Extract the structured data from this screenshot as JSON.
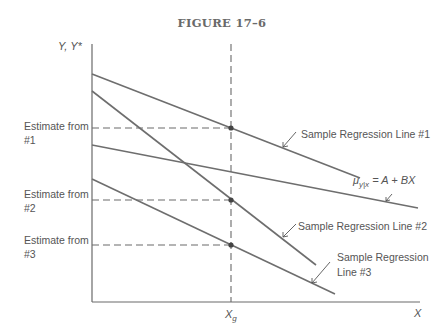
{
  "figure": {
    "title": "FIGURE 17–6",
    "y_axis_label": "Y, Y*",
    "x_axis_label": "X",
    "x_marker_label": "X",
    "x_marker_subscript": "g",
    "estimates": [
      {
        "line1": "Estimate from",
        "line2": "#1"
      },
      {
        "line1": "Estimate from",
        "line2": "#2"
      },
      {
        "line1": "Estimate from",
        "line2": "#3"
      }
    ],
    "lines": [
      {
        "id": "sample1",
        "label": "Sample Regression Line #1"
      },
      {
        "id": "sample2",
        "label": "Sample Regression Line #2"
      },
      {
        "id": "sample3",
        "label_line1": "Sample Regression",
        "label_line2": "Line #3"
      },
      {
        "id": "population",
        "label_mu": "μ",
        "label_sub": "y|x",
        "label_rest": " = A + BX"
      }
    ]
  }
}
